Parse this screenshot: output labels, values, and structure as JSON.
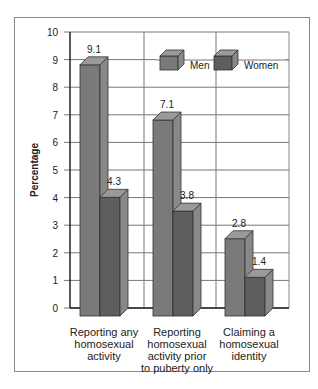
{
  "chart_data": {
    "type": "bar",
    "title": "",
    "xlabel": "",
    "ylabel": "Percentage",
    "ylim": [
      0,
      10
    ],
    "yticks": [
      0,
      1,
      2,
      3,
      4,
      5,
      6,
      7,
      8,
      9,
      10
    ],
    "grid": true,
    "legend_position": "top-right",
    "categories": [
      "Reporting any homosexual activity",
      "Reporting homosexual activity prior to puberty only",
      "Claiming a homosexual identity"
    ],
    "category_lines": [
      [
        "Reporting any",
        "homosexual",
        "activity"
      ],
      [
        "Reporting",
        "homosexual",
        "activity prior",
        "to puberty only"
      ],
      [
        "Claiming a",
        "homosexual",
        "identity"
      ]
    ],
    "series": [
      {
        "name": "Men",
        "values": [
          9.1,
          7.1,
          2.8
        ],
        "color": "#7a7a7a"
      },
      {
        "name": "Women",
        "values": [
          4.3,
          3.8,
          1.4
        ],
        "color": "#5e5e5e"
      }
    ],
    "data_labels": [
      [
        "9.1",
        "4.3"
      ],
      [
        "7.1",
        "3.8"
      ],
      [
        "2.8",
        "1.4"
      ]
    ]
  },
  "legend": {
    "men": "Men",
    "women": "Women"
  },
  "axis": {
    "ylabel": "Percentage"
  }
}
